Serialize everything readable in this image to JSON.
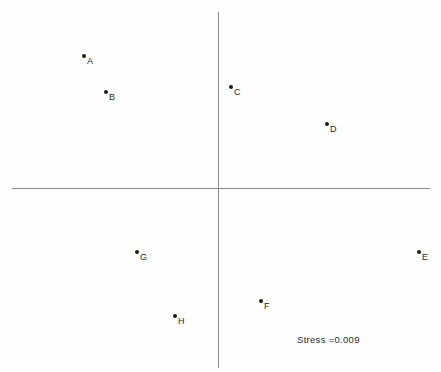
{
  "figure": {
    "background_color": "#fefefe",
    "axis_color": "#8a8a8a",
    "point_color": "#1c1c1c",
    "label_color": "#2a2a2a",
    "annotation": "Stress =0.009"
  },
  "chart_data": {
    "type": "scatter",
    "title": "",
    "xlabel": "",
    "ylabel": "",
    "xlim": [
      -1.08,
      1.08
    ],
    "ylim": [
      -0.95,
      0.95
    ],
    "grid": false,
    "legend": false,
    "axes_style": "crosshair-through-origin",
    "annotations": [
      {
        "text": "Stress =0.009",
        "x": 0.39,
        "y": -0.8
      }
    ],
    "points": [
      {
        "label": "A",
        "x": -0.64,
        "y": 0.76,
        "px": 84,
        "py": 56
      },
      {
        "label": "B",
        "x": -0.54,
        "y": 0.56,
        "px": 106,
        "py": 92
      },
      {
        "label": "C",
        "x": 0.06,
        "y": 0.59,
        "px": 231,
        "py": 87
      },
      {
        "label": "D",
        "x": 0.52,
        "y": 0.38,
        "px": 327,
        "py": 124
      },
      {
        "label": "E",
        "x": 0.96,
        "y": -0.36,
        "px": 419,
        "py": 252
      },
      {
        "label": "F",
        "x": 0.2,
        "y": -0.65,
        "px": 261,
        "py": 301
      },
      {
        "label": "G",
        "x": -0.4,
        "y": -0.36,
        "px": 137,
        "py": 252
      },
      {
        "label": "H",
        "x": -0.22,
        "y": -0.73,
        "px": 175,
        "py": 316
      }
    ]
  }
}
